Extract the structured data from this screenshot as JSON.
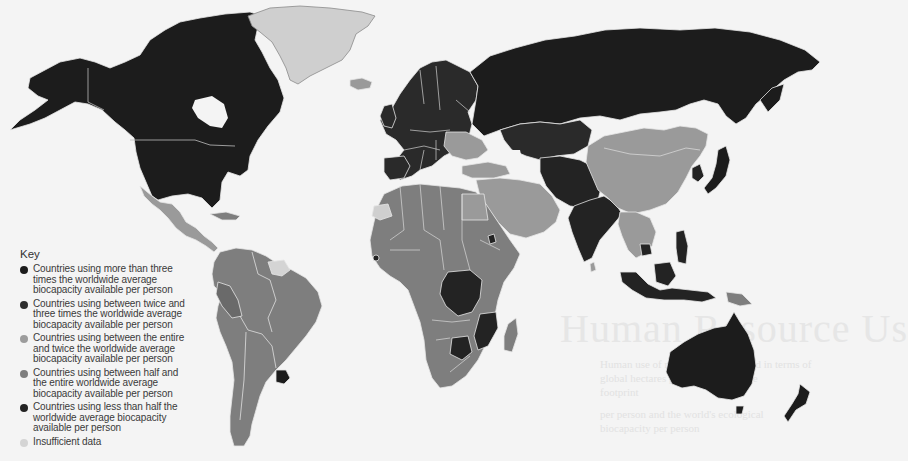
{
  "map": {
    "title": "Worldwide ecological footprint vs. biocapacity",
    "colors": {
      "more_than_three_times": "#1c1c1c",
      "twice_to_three_times": "#2a2a2a",
      "entire_to_twice": "#9a9a9a",
      "half_to_entire": "#7e7e7e",
      "less_than_half": "#232323",
      "insufficient_data": "#cfcfcf",
      "ocean": "#f4f4f4",
      "border": "#e8e8e8"
    },
    "regions": [
      {
        "name": "North America (USA, Canada, Alaska)",
        "category": "more_than_three_times"
      },
      {
        "name": "Greenland",
        "category": "insufficient_data"
      },
      {
        "name": "Mexico & Central America",
        "category": "entire_to_twice"
      },
      {
        "name": "South America",
        "category": "half_to_entire"
      },
      {
        "name": "Uruguay",
        "category": "more_than_three_times"
      },
      {
        "name": "Guyana region",
        "category": "insufficient_data"
      },
      {
        "name": "Europe",
        "category": "twice_to_three_times"
      },
      {
        "name": "Russia",
        "category": "more_than_three_times"
      },
      {
        "name": "Kazakhstan",
        "category": "twice_to_three_times"
      },
      {
        "name": "Middle East",
        "category": "entire_to_twice"
      },
      {
        "name": "North & West Africa",
        "category": "half_to_entire"
      },
      {
        "name": "DR Congo",
        "category": "less_than_half"
      },
      {
        "name": "Mozambique",
        "category": "less_than_half"
      },
      {
        "name": "Botswana",
        "category": "less_than_half"
      },
      {
        "name": "China & Mongolia",
        "category": "entire_to_twice"
      },
      {
        "name": "India & Pakistan",
        "category": "less_than_half"
      },
      {
        "name": "Japan",
        "category": "more_than_three_times"
      },
      {
        "name": "Southeast Asia",
        "category": "entire_to_twice"
      },
      {
        "name": "Indonesia & Philippines",
        "category": "less_than_half"
      },
      {
        "name": "Papua New Guinea",
        "category": "half_to_entire"
      },
      {
        "name": "Australia",
        "category": "more_than_three_times"
      },
      {
        "name": "New Zealand",
        "category": "more_than_three_times"
      },
      {
        "name": "Madagascar",
        "category": "half_to_entire"
      }
    ]
  },
  "key": {
    "title": "Key",
    "items": [
      {
        "label": "Countries using more than three times the worldwide average biocapacity available per person",
        "color": "#1c1c1c"
      },
      {
        "label": "Countries using between twice and three times the worldwide average biocapacity available per person",
        "color": "#2e2e2e"
      },
      {
        "label": "Countries using between the entire and twice the worldwide average biocapacity available per person",
        "color": "#9c9c9c"
      },
      {
        "label": "Countries using between half and the entire worldwide average biocapacity available per person",
        "color": "#7e7e7e"
      },
      {
        "label": "Countries using less than half the worldwide average biocapacity available per person",
        "color": "#232323"
      },
      {
        "label": "Insufficient data",
        "color": "#d4d4d4"
      }
    ]
  },
  "ghost_text": {
    "title": "Human Resource Us",
    "lines": [
      "Human use of resources is measured in terms of",
      "global hectares per person available",
      "footprint",
      "per person and the world's ecological",
      "biocapacity per person"
    ]
  }
}
